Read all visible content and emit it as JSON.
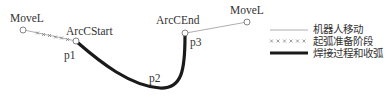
{
  "diagram": {
    "points": {
      "movel_start": "MoveL",
      "arc_start": "ArcCStart",
      "arc_end": "ArcCEnd",
      "movel_end": "MoveL",
      "p1": "p1",
      "p2": "p2",
      "p3": "p3"
    },
    "legend": [
      {
        "style": "thin-line",
        "label": "机器人移动"
      },
      {
        "style": "crosses",
        "label": "起弧准备阶段"
      },
      {
        "style": "thick-line",
        "label": "焊接过程和收弧"
      }
    ],
    "colors": {
      "thin_line": "#888888",
      "thick_line": "#1a1a1a",
      "text": "#333333"
    }
  }
}
